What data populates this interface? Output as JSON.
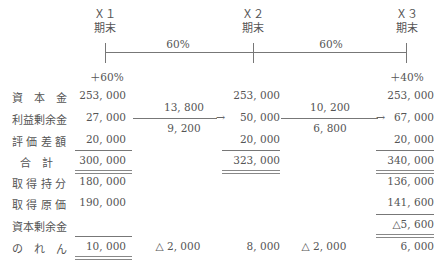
{
  "periods": [
    {
      "id": "X1",
      "label": "Ｘ１",
      "sub": "期末",
      "change": "＋60%"
    },
    {
      "id": "X2",
      "label": "Ｘ２",
      "sub": "期末",
      "change": ""
    },
    {
      "id": "X3",
      "label": "Ｘ３",
      "sub": "期末",
      "change": "＋40%"
    }
  ],
  "timeline": {
    "segment1_ratio": "60%",
    "segment2_ratio": "60%"
  },
  "rows": [
    {
      "label": "資　本　金",
      "x1": "253, 000",
      "x2": "253, 000",
      "x3": "253, 000"
    },
    {
      "label": "利益剰余金",
      "x1": "27, 000",
      "x2": "50, 000",
      "x3": "67, 000"
    },
    {
      "label": "評 価 差 額",
      "x1": "20, 000",
      "x2": "20, 000",
      "x3": "20, 000"
    },
    {
      "label": "合　計",
      "x1": "300, 000",
      "x2": "323, 000",
      "x3": "340, 000"
    },
    {
      "label": "取 得 持 分",
      "x1": "180, 000",
      "x2": "",
      "x3": "136, 000"
    },
    {
      "label": "取 得 原 価",
      "x1": "190, 000",
      "x2": "",
      "x3": "141, 600"
    },
    {
      "label": "資本剰余金",
      "x1": "",
      "x2": "",
      "x3": "△5, 600"
    },
    {
      "label": "の　れ　ん",
      "x1": "10, 000",
      "x2": "8, 000",
      "x3": "6, 000"
    }
  ],
  "transfers": {
    "x1_to_x2_upper": "13, 800",
    "x1_to_x2_lower": "9, 200",
    "x2_to_x3_upper": "10, 200",
    "x2_to_x3_lower": "6, 800"
  },
  "goodwill_amortization": {
    "x1_to_x2": "△ 2, 000",
    "x2_to_x3": "△ 2, 000"
  }
}
